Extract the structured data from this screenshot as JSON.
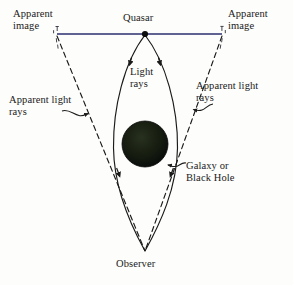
{
  "figure": {
    "background_color": "#fdfdfb",
    "ink_color": "#1a1a1a",
    "horizon_line_color": "#2b2f6e",
    "lens_body_color": "#0f1a0c"
  },
  "labels": {
    "apparent_image_left": "Apparent\nimage",
    "apparent_image_right": "Apparent\nimage",
    "quasar": "Quasar",
    "light_rays": "Light\nrays",
    "apparent_light_rays_left": "Apparent light\nrays",
    "apparent_light_rays_right": "Apparent light\nrays",
    "galaxy_or_black_hole": "Galaxy or\nBlack Hole",
    "observer": "Observer"
  },
  "geometry": {
    "quasar_point": [
      145,
      34
    ],
    "observer_point": [
      145,
      252
    ],
    "lens_center": [
      145,
      144
    ],
    "lens_radius": 23,
    "sightline_y": 34,
    "sightline_x_left": 57,
    "sightline_x_right": 222,
    "real_ray_bulge_left_x": 113,
    "real_ray_bulge_right_x": 178,
    "apparent_ray_top_left": [
      57,
      36
    ],
    "apparent_ray_top_right": [
      222,
      36
    ]
  },
  "elements": {
    "quasar_dot": "filled-black-dot",
    "apparent_image_marker_left": "bracket-tick",
    "apparent_image_marker_right": "bracket-tick",
    "real_ray_style": "solid-curved-with-downward-arrowheads",
    "apparent_ray_style": "dashed-straight",
    "pointer_style": "squiggle-arrow"
  }
}
